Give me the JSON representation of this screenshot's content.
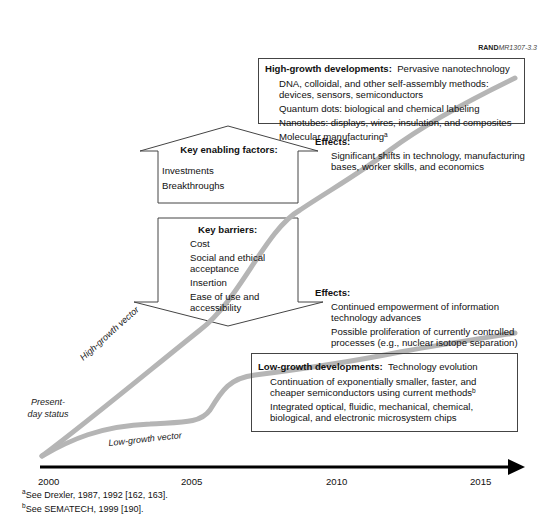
{
  "figure_id": {
    "brand": "RAND",
    "code": "MR1307-3.3"
  },
  "high_growth_box": {
    "title": "High-growth developments:",
    "subtitle": "Pervasive nanotechnology",
    "items": [
      "DNA, colloidal, and other self-assembly methods:  devices, sensors, semiconductors",
      "Quantum dots:  biological and chemical labeling",
      "Nanotubes:  displays, wires, insulation, and composites",
      "Molecular manufacturing"
    ],
    "item_4_sup": "a"
  },
  "effects_high": {
    "heading": "Effects:",
    "items": [
      "Significant shifts in technology, manufacturing bases, worker skills, and economics"
    ]
  },
  "enabling_arrow": {
    "heading": "Key enabling factors:",
    "items": [
      "Investments",
      "Breakthroughs"
    ]
  },
  "barriers_arrow": {
    "heading": "Key barriers:",
    "items": [
      "Cost",
      "Social and ethical acceptance",
      "Insertion",
      "Ease of use and accessibility"
    ]
  },
  "effects_low": {
    "heading": "Effects:",
    "items": [
      "Continued empowerment of information technology advances",
      "Possible proliferation of currently controlled processes (e.g., nuclear isotope separation)"
    ]
  },
  "low_growth_box": {
    "title": "Low-growth developments:",
    "subtitle": "Technology evolution",
    "items": [
      "Continuation of exponentially smaller, faster, and cheaper semiconductors using current methods",
      "Integrated optical, fluidic, mechanical, chemical, biological, and electronic microsystem chips"
    ],
    "item_1_sup": "b"
  },
  "vectors": {
    "high": "High-growth vector",
    "low": "Low-growth vector",
    "start": "Present-day status"
  },
  "timeline": {
    "ticks": [
      "2000",
      "2005",
      "2010",
      "2015"
    ]
  },
  "footnotes": [
    {
      "mark": "a",
      "text": "See Drexler, 1987, 1992 [162, 163]."
    },
    {
      "mark": "b",
      "text": "See SEMATECH, 1999 [190]."
    }
  ],
  "colors": {
    "curve": "#b5b5b5",
    "axis": "#000000",
    "box_border": "#444444"
  }
}
